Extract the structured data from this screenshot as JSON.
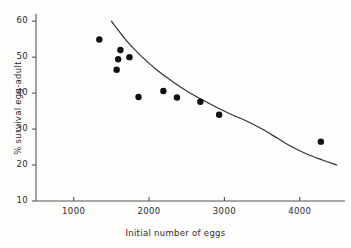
{
  "chart_data": {
    "type": "scatter",
    "title": "",
    "xlabel": "Initial number of eggs",
    "ylabel": "% survival egg-adult",
    "xlim": [
      500,
      4600
    ],
    "ylim": [
      10,
      62
    ],
    "xticks": [
      1000,
      2000,
      3000,
      4000
    ],
    "xtick_labels": [
      "1000",
      "2000",
      "3000",
      "4000"
    ],
    "yticks": [
      10,
      20,
      30,
      40,
      50,
      60
    ],
    "ytick_labels": [
      "10",
      "20",
      "30",
      "40",
      "50",
      "60"
    ],
    "grid": false,
    "legend": "none",
    "marker": "filled-circle",
    "marker_color": "#111111",
    "line_color": "#333333",
    "axis_color": "#555555",
    "background_color": "#fdfdfb",
    "points": [
      {
        "x": 1340,
        "y": 54.9
      },
      {
        "x": 1620,
        "y": 52.0
      },
      {
        "x": 1590,
        "y": 49.4
      },
      {
        "x": 1740,
        "y": 50.0
      },
      {
        "x": 1570,
        "y": 46.5
      },
      {
        "x": 1860,
        "y": 38.9
      },
      {
        "x": 2190,
        "y": 40.6
      },
      {
        "x": 2370,
        "y": 38.8
      },
      {
        "x": 2680,
        "y": 37.6
      },
      {
        "x": 2930,
        "y": 34.0
      },
      {
        "x": 4280,
        "y": 26.5
      }
    ],
    "fitted_curve": {
      "description": "smooth decreasing fitted curve",
      "points": [
        {
          "x": 1500,
          "y": 60.0
        },
        {
          "x": 1700,
          "y": 54.6
        },
        {
          "x": 1900,
          "y": 50.2
        },
        {
          "x": 2100,
          "y": 46.5
        },
        {
          "x": 2300,
          "y": 43.4
        },
        {
          "x": 2500,
          "y": 40.6
        },
        {
          "x": 2700,
          "y": 38.2
        },
        {
          "x": 2900,
          "y": 36.0
        },
        {
          "x": 3100,
          "y": 34.0
        },
        {
          "x": 3300,
          "y": 32.2
        },
        {
          "x": 3500,
          "y": 30.0
        },
        {
          "x": 3700,
          "y": 27.5
        },
        {
          "x": 3900,
          "y": 25.0
        },
        {
          "x": 4100,
          "y": 23.0
        },
        {
          "x": 4300,
          "y": 21.4
        },
        {
          "x": 4490,
          "y": 20.0
        }
      ]
    }
  }
}
